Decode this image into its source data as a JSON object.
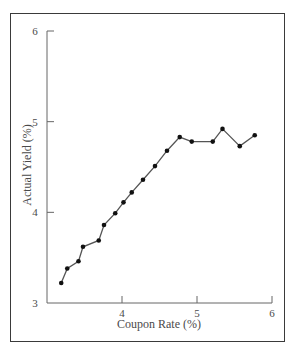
{
  "chart_data": {
    "type": "line",
    "title": "",
    "xlabel": "Coupon Rate (%)",
    "ylabel": "Actual Yield (%)",
    "xlim": [
      3,
      6
    ],
    "ylim": [
      3,
      6
    ],
    "xticks": [
      4,
      5,
      6
    ],
    "yticks": [
      3,
      4,
      5,
      6
    ],
    "grid": false,
    "legend": null,
    "markers": true,
    "series": [
      {
        "name": "Actual Yield",
        "x": [
          3.19,
          3.27,
          3.42,
          3.48,
          3.69,
          3.76,
          3.91,
          4.02,
          4.13,
          4.28,
          4.44,
          4.6,
          4.77,
          4.93,
          5.21,
          5.34,
          5.57,
          5.77
        ],
        "y": [
          3.22,
          3.38,
          3.46,
          3.62,
          3.69,
          3.86,
          3.99,
          4.11,
          4.22,
          4.36,
          4.51,
          4.68,
          4.83,
          4.78,
          4.78,
          4.92,
          4.73,
          4.85
        ]
      }
    ]
  },
  "colors": {
    "line": "#555555",
    "marker": "#111111",
    "axis": "#666666",
    "frame": "#3a3a3a"
  }
}
